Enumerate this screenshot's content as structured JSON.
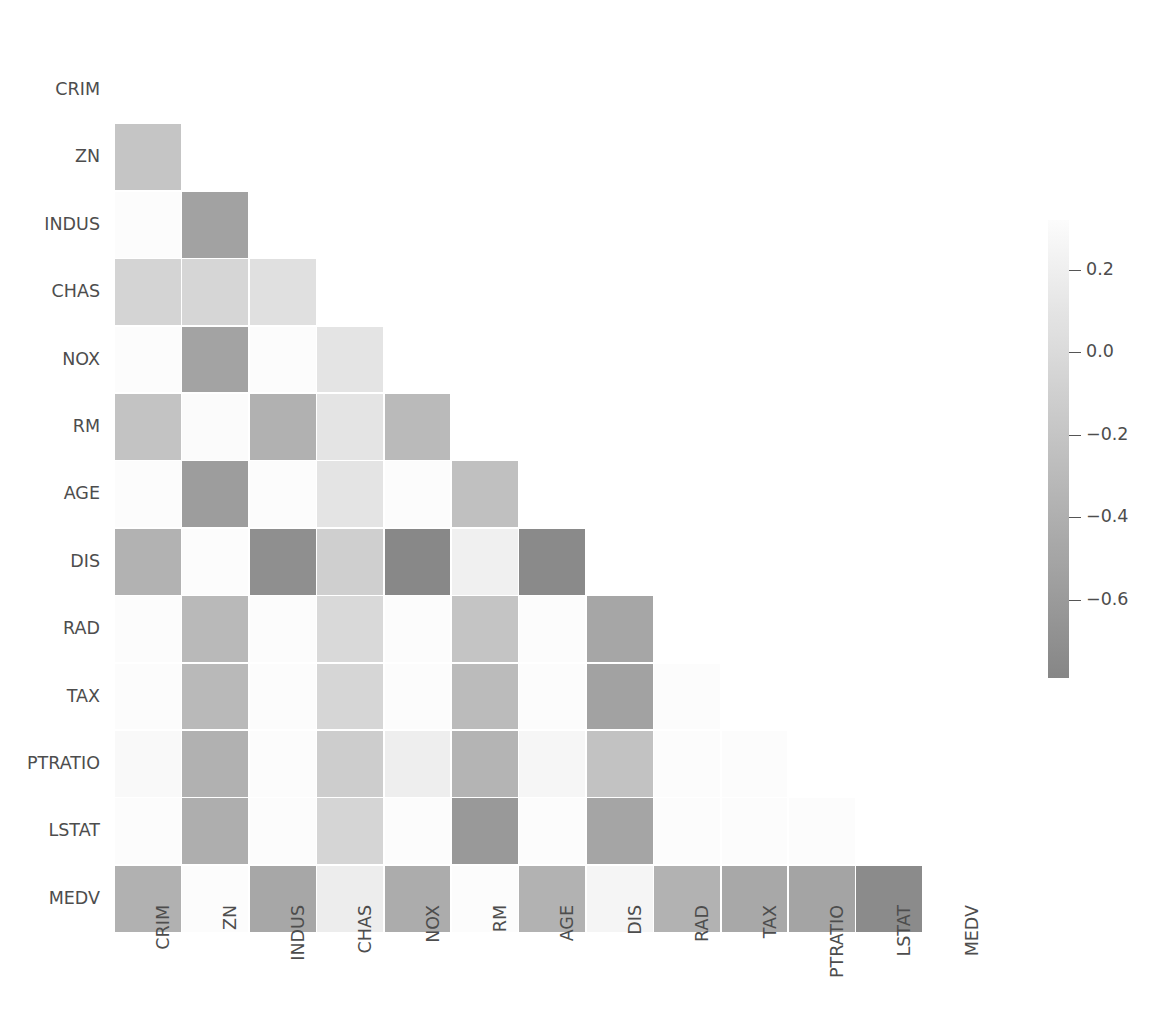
{
  "chart_data": {
    "type": "heatmap",
    "title": "",
    "xlabel": "",
    "ylabel": "",
    "grid": false,
    "mask": "lower-triangle-excluding-diagonal",
    "colormap": "grayscale-light-high-to-dark-low",
    "categories": [
      "CRIM",
      "ZN",
      "INDUS",
      "CHAS",
      "NOX",
      "RM",
      "AGE",
      "DIS",
      "RAD",
      "TAX",
      "PTRATIO",
      "LSTAT",
      "MEDV"
    ],
    "x_tick_labels": [
      "CRIM",
      "ZN",
      "INDUS",
      "CHAS",
      "NOX",
      "RM",
      "AGE",
      "DIS",
      "RAD",
      "TAX",
      "PTRATIO",
      "LSTAT",
      "MEDV"
    ],
    "y_tick_labels": [
      "CRIM",
      "ZN",
      "INDUS",
      "CHAS",
      "NOX",
      "RM",
      "AGE",
      "DIS",
      "RAD",
      "TAX",
      "PTRATIO",
      "LSTAT",
      "MEDV"
    ],
    "x_tick_rotation_deg": 90,
    "rows": [
      {
        "label": "CRIM",
        "values": [
          null,
          null,
          null,
          null,
          null,
          null,
          null,
          null,
          null,
          null,
          null,
          null,
          null
        ]
      },
      {
        "label": "ZN",
        "values": [
          -0.2,
          null,
          null,
          null,
          null,
          null,
          null,
          null,
          null,
          null,
          null,
          null,
          null
        ]
      },
      {
        "label": "INDUS",
        "values": [
          0.41,
          -0.53,
          null,
          null,
          null,
          null,
          null,
          null,
          null,
          null,
          null,
          null,
          null
        ]
      },
      {
        "label": "CHAS",
        "values": [
          -0.06,
          -0.04,
          0.06,
          null,
          null,
          null,
          null,
          null,
          null,
          null,
          null,
          null,
          null
        ]
      },
      {
        "label": "NOX",
        "values": [
          0.42,
          -0.52,
          0.76,
          0.09,
          null,
          null,
          null,
          null,
          null,
          null,
          null,
          null,
          null
        ]
      },
      {
        "label": "RM",
        "values": [
          -0.22,
          0.31,
          -0.39,
          0.09,
          -0.3,
          null,
          null,
          null,
          null,
          null,
          null,
          null,
          null
        ]
      },
      {
        "label": "AGE",
        "values": [
          0.35,
          -0.57,
          0.64,
          0.09,
          0.73,
          -0.24,
          null,
          null,
          null,
          null,
          null,
          null,
          null
        ]
      },
      {
        "label": "DIS",
        "values": [
          -0.38,
          0.66,
          -0.71,
          -0.1,
          -0.77,
          0.21,
          -0.75,
          null,
          null,
          null,
          null,
          null,
          null
        ]
      },
      {
        "label": "RAD",
        "values": [
          0.63,
          -0.31,
          0.6,
          -0.01,
          0.61,
          -0.21,
          0.46,
          -0.49,
          null,
          null,
          null,
          null,
          null
        ]
      },
      {
        "label": "TAX",
        "values": [
          0.58,
          -0.31,
          0.72,
          -0.04,
          0.67,
          -0.29,
          0.51,
          -0.53,
          0.91,
          null,
          null,
          null,
          null
        ]
      },
      {
        "label": "PTRATIO",
        "values": [
          0.29,
          -0.39,
          0.38,
          -0.12,
          0.19,
          -0.36,
          0.26,
          -0.23,
          0.46,
          0.46,
          null,
          null,
          null
        ]
      },
      {
        "label": "LSTAT",
        "values": [
          0.46,
          -0.41,
          0.6,
          -0.05,
          0.59,
          -0.61,
          0.6,
          -0.5,
          0.49,
          0.54,
          0.37,
          null,
          null
        ]
      },
      {
        "label": "MEDV",
        "values": [
          -0.39,
          0.36,
          -0.48,
          0.18,
          -0.43,
          0.7,
          -0.38,
          0.25,
          -0.38,
          -0.47,
          -0.51,
          -0.74,
          null
        ]
      }
    ],
    "colorbar": {
      "orientation": "vertical",
      "position": "right",
      "vmin": -0.79,
      "vmax": 0.32,
      "ticks": [
        0.2,
        0.0,
        -0.2,
        -0.4,
        -0.6
      ],
      "tick_labels": [
        "0.2",
        "0.0",
        "−0.2",
        "−0.4",
        "−0.6"
      ]
    }
  }
}
